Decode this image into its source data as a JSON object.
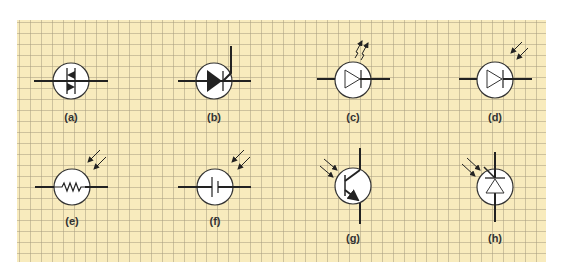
{
  "figure": {
    "background_color": "#f8ebbd",
    "grid_color": "#b4aa86",
    "line_color": "#222222",
    "symbols": [
      {
        "id": "a",
        "label": "(a)",
        "component": "diac-triac"
      },
      {
        "id": "b",
        "label": "(b)",
        "component": "thyristor-scr"
      },
      {
        "id": "c",
        "label": "(c)",
        "component": "light-emitting-diode"
      },
      {
        "id": "d",
        "label": "(d)",
        "component": "photodiode"
      },
      {
        "id": "e",
        "label": "(e)",
        "component": "light-dependent-resistor"
      },
      {
        "id": "f",
        "label": "(f)",
        "component": "photovoltaic-cell"
      },
      {
        "id": "g",
        "label": "(g)",
        "component": "phototransistor"
      },
      {
        "id": "h",
        "label": "(h)",
        "component": "photo-zener-diode"
      }
    ]
  }
}
